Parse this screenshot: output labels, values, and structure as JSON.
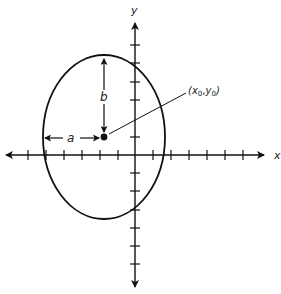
{
  "figure": {
    "type": "ellipse-diagram",
    "axes": {
      "x_label": "x",
      "y_label": "y"
    },
    "ellipse": {
      "center_label_open": "(",
      "center_x_var": "x",
      "center_x_sub": "0",
      "center_sep": ",",
      "center_y_var": "y",
      "center_y_sub": "0",
      "center_label_close": ")",
      "semi_axis_horizontal_label": "a",
      "semi_axis_vertical_label": "b"
    },
    "colors": {
      "stroke": "#111111",
      "background": "#ffffff"
    }
  }
}
